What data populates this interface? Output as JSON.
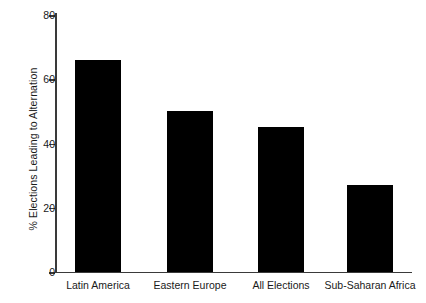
{
  "chart_data": {
    "type": "bar",
    "title": "",
    "xlabel": "",
    "ylabel": "% Elections Leading to Alternation",
    "categories": [
      "Latin America",
      "Eastern Europe",
      "All Elections",
      "Sub-Saharan Africa"
    ],
    "values": [
      66,
      50,
      45,
      27
    ],
    "ylim": [
      0,
      80
    ],
    "yticks": [
      0,
      20,
      40,
      60,
      80
    ],
    "ytick_labels": [
      "0",
      "20",
      "40",
      "60",
      "80"
    ],
    "grid": false,
    "legend": null,
    "bar_color": "#000000",
    "background_color": "#ffffff",
    "axis_color": "#3a3a3a"
  }
}
